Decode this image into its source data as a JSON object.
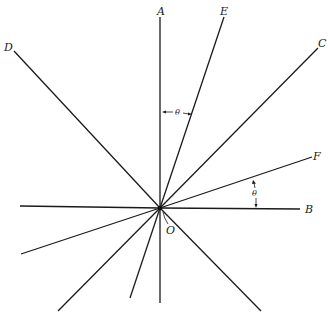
{
  "figure": {
    "origin": {
      "label": "O",
      "x": 160,
      "y": 208
    },
    "labels": {
      "A": "A",
      "E": "E",
      "C": "C",
      "D": "D",
      "F": "F",
      "B": "B",
      "O": "O"
    },
    "angle_symbol": "θ",
    "rays": [
      {
        "name": "A",
        "x1": 160,
        "y1": 208,
        "x2": 160,
        "y2": 17
      },
      {
        "name": "E",
        "x1": 160,
        "y1": 208,
        "x2": 224,
        "y2": 17
      },
      {
        "name": "C",
        "x1": 160,
        "y1": 208,
        "x2": 318,
        "y2": 48
      },
      {
        "name": "D",
        "x1": 160,
        "y1": 208,
        "x2": 14,
        "y2": 51
      },
      {
        "name": "F",
        "x1": 160,
        "y1": 208,
        "x2": 312,
        "y2": 157
      },
      {
        "name": "B",
        "x1": 160,
        "y1": 208,
        "x2": 300,
        "y2": 209
      },
      {
        "name": "B-opposite",
        "x1": 160,
        "y1": 208,
        "x2": 20,
        "y2": 206
      },
      {
        "name": "F-opposite",
        "x1": 160,
        "y1": 208,
        "x2": 21,
        "y2": 254
      },
      {
        "name": "C-opposite",
        "x1": 160,
        "y1": 208,
        "x2": 58,
        "y2": 311
      },
      {
        "name": "E-opposite",
        "x1": 160,
        "y1": 208,
        "x2": 130,
        "y2": 298
      },
      {
        "name": "A-opposite",
        "x1": 160,
        "y1": 208,
        "x2": 160,
        "y2": 303
      },
      {
        "name": "D-opposite",
        "x1": 160,
        "y1": 208,
        "x2": 261,
        "y2": 311
      }
    ]
  }
}
